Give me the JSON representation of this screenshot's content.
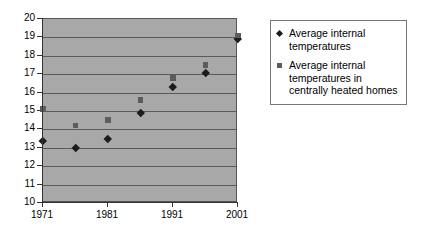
{
  "chart_data": {
    "type": "scatter",
    "title": "",
    "subtitle": "",
    "xlabel": "",
    "ylabel": "",
    "x": [
      1971,
      1976,
      1981,
      1986,
      1991,
      1996,
      2001
    ],
    "xlim": [
      1971,
      2001
    ],
    "ylim": [
      10,
      20
    ],
    "x_tick_labels": [
      "1971",
      "1981",
      "1991",
      "2001"
    ],
    "x_tick_values": [
      1971,
      1981,
      1991,
      2001
    ],
    "y_tick_labels": [
      "10",
      "11",
      "12",
      "13",
      "14",
      "15",
      "16",
      "17",
      "18",
      "19",
      "20"
    ],
    "y_tick_values": [
      10,
      11,
      12,
      13,
      14,
      15,
      16,
      17,
      18,
      19,
      20
    ],
    "grid": true,
    "grid_axis": "y",
    "legend_position": "right",
    "plot_background": "#a8a8a8",
    "series": [
      {
        "name": "Average internal temperatures",
        "marker": "diamond",
        "color": "#1c1c1c",
        "values": [
          13.4,
          13.0,
          13.5,
          14.9,
          16.3,
          17.1,
          18.9
        ]
      },
      {
        "name": "Average internal temperatures in centrally heated homes",
        "marker": "square",
        "color": "#5c5c5c",
        "values": [
          15.1,
          14.2,
          14.5,
          15.6,
          16.8,
          17.5,
          19.1
        ]
      }
    ]
  },
  "legend": {
    "entries": [
      {
        "label": "Average internal temperatures",
        "marker": "diamond-marker-icon"
      },
      {
        "label": "Average internal temperatures in centrally heated homes",
        "marker": "square-marker-icon"
      }
    ]
  }
}
